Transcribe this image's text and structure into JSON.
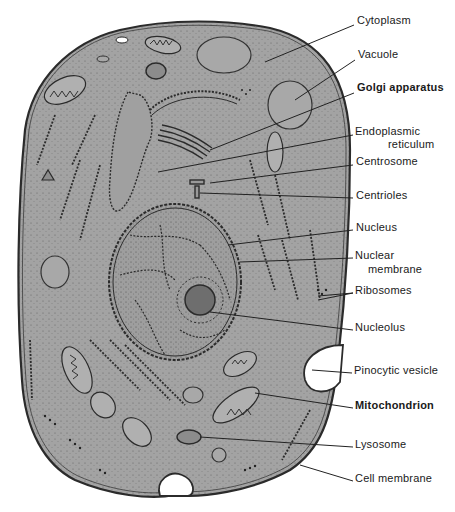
{
  "diagram": {
    "colors": {
      "cytoplasm": "#a3a3a3",
      "outline": "#2b2b2b",
      "background": "#ffffff",
      "vesicle": "#ffffff"
    }
  },
  "labels": [
    {
      "id": "cytoplasm",
      "text": "Cytoplasm",
      "x": 357,
      "y": 19
    },
    {
      "id": "vacuole",
      "text": "Vacuole",
      "x": 358,
      "y": 53
    },
    {
      "id": "golgi",
      "text": "Golgi apparatus",
      "x": 357,
      "y": 86
    },
    {
      "id": "er-line1",
      "text": "Endoplasmic",
      "x": 355,
      "y": 130
    },
    {
      "id": "er-line2",
      "text": "reticulum",
      "x": 388,
      "y": 142
    },
    {
      "id": "centrosome",
      "text": "Centrosome",
      "x": 356,
      "y": 159
    },
    {
      "id": "centrioles",
      "text": "Centrioles",
      "x": 356,
      "y": 193
    },
    {
      "id": "nucleus",
      "text": "Nucleus",
      "x": 356,
      "y": 225
    },
    {
      "id": "nuclear-line1",
      "text": "Nuclear",
      "x": 355,
      "y": 253
    },
    {
      "id": "nuclear-line2",
      "text": "membrane",
      "x": 368,
      "y": 267
    },
    {
      "id": "ribosomes",
      "text": "Ribosomes",
      "x": 355,
      "y": 288
    },
    {
      "id": "nucleolus",
      "text": "Nucleolus",
      "x": 355,
      "y": 325
    },
    {
      "id": "pinocytic",
      "text": "Pinocytic vesicle",
      "x": 354,
      "y": 368
    },
    {
      "id": "mitochondrion",
      "text": "Mitochondrion",
      "x": 355,
      "y": 403
    },
    {
      "id": "lysosome",
      "text": "Lysosome",
      "x": 355,
      "y": 442
    },
    {
      "id": "cell-membrane",
      "text": "Cell membrane",
      "x": 355,
      "y": 476
    }
  ]
}
